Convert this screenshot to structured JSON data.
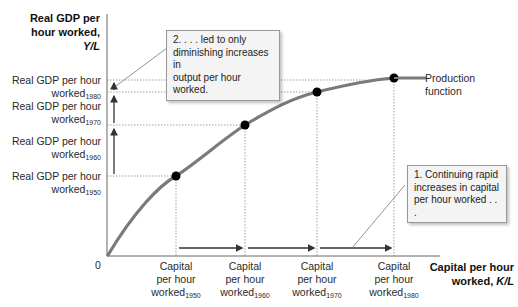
{
  "y_axis": {
    "title_line1": "Real GDP per",
    "title_line2": "hour worked,",
    "title_line3": "Y/L",
    "ticks": [
      {
        "line1": "Real GDP per hour",
        "line2": "worked",
        "sub": "1980"
      },
      {
        "line1": "Real GDP per hour",
        "line2": "worked",
        "sub": "1970"
      },
      {
        "line1": "Real GDP per hour",
        "line2": "worked",
        "sub": "1960"
      },
      {
        "line1": "Real GDP per hour",
        "line2": "worked",
        "sub": "1950"
      }
    ]
  },
  "x_axis": {
    "origin": "0",
    "title_line1": "Capital per hour",
    "title_line2": "worked,",
    "title_italic": "K/L",
    "ticks": [
      {
        "line1": "Capital",
        "line2": "per hour",
        "line3": "worked",
        "sub": "1950"
      },
      {
        "line1": "Capital",
        "line2": "per hour",
        "line3": "worked",
        "sub": "1960"
      },
      {
        "line1": "Capital",
        "line2": "per hour",
        "line3": "worked",
        "sub": "1970"
      },
      {
        "line1": "Capital",
        "line2": "per hour",
        "line3": "worked",
        "sub": "1980"
      }
    ]
  },
  "curve_label": {
    "line1": "Production",
    "line2": "function"
  },
  "callouts": {
    "one": {
      "line1": "1. Continuing rapid",
      "line2": "increases in capital",
      "line3": "per hour worked . . ."
    },
    "two": {
      "line1": "2. . . . led to only",
      "line2": "diminishing increases in",
      "line3": "output per hour worked."
    }
  },
  "colors": {
    "curve": "#7a7a7a",
    "points": "#000000",
    "axis": "#555555",
    "callout_bg": "#f4f4f4"
  }
}
